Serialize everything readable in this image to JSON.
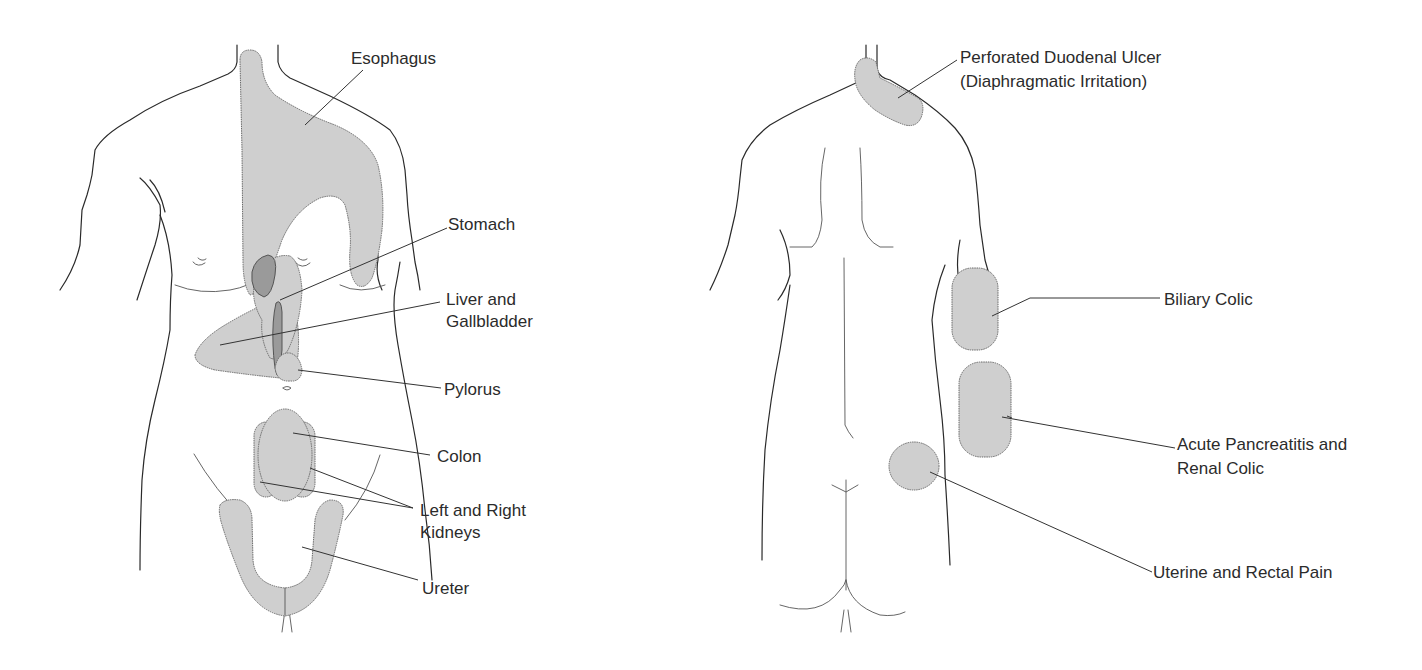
{
  "figure": {
    "colors": {
      "region_fill": "#cfcfcf",
      "region_overlap": "#9a9a9a",
      "outline": "#2a2a2a",
      "background": "#ffffff"
    },
    "front_view": {
      "name": "Anterior view",
      "labels": [
        {
          "id": "esophagus",
          "text": "Esophagus"
        },
        {
          "id": "stomach",
          "text": "Stomach"
        },
        {
          "id": "liver-gallbladder",
          "lines": [
            "Liver and",
            "Gallbladder"
          ]
        },
        {
          "id": "pylorus",
          "text": "Pylorus"
        },
        {
          "id": "colon",
          "text": "Colon"
        },
        {
          "id": "kidneys",
          "lines": [
            "Left and Right",
            "Kidneys"
          ]
        },
        {
          "id": "ureter",
          "text": "Ureter"
        }
      ]
    },
    "back_view": {
      "name": "Posterior view",
      "labels": [
        {
          "id": "perforated-duodenal-ulcer",
          "lines": [
            "Perforated Duodenal Ulcer",
            "(Diaphragmatic Irritation)"
          ]
        },
        {
          "id": "biliary-colic",
          "text": "Biliary Colic"
        },
        {
          "id": "pancreatitis-renal-colic",
          "lines": [
            "Acute Pancreatitis and",
            "Renal Colic"
          ]
        },
        {
          "id": "uterine-rectal-pain",
          "text": "Uterine and Rectal Pain"
        }
      ]
    }
  }
}
